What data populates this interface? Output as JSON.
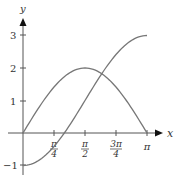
{
  "chart_data": {
    "type": "line",
    "title": "",
    "xlabel": "x",
    "ylabel": "y",
    "x_ticks": [
      {
        "value": 0.7854,
        "label_num": "π",
        "label_den": "4"
      },
      {
        "value": 1.5708,
        "label_num": "π",
        "label_den": "2"
      },
      {
        "value": 2.3562,
        "label_num": "3π",
        "label_den": "4"
      },
      {
        "value": 3.1416,
        "label": "π"
      }
    ],
    "y_ticks": [
      {
        "value": 3,
        "label": "3"
      },
      {
        "value": 2,
        "label": "2"
      },
      {
        "value": 1,
        "label": "1"
      },
      {
        "value": -1,
        "label": "−1"
      }
    ],
    "xlim": [
      0,
      3.1416
    ],
    "ylim": [
      -1,
      3
    ],
    "grid": false,
    "series": [
      {
        "name": "y = 2 sin x",
        "x": [
          0,
          0.3927,
          0.7854,
          1.1781,
          1.5708,
          1.9635,
          2.3562,
          2.7489,
          3.1416
        ],
        "values": [
          0,
          0.765,
          1.414,
          1.848,
          2.0,
          1.848,
          1.414,
          0.765,
          0
        ]
      },
      {
        "name": "y = 1 − 2 cos x",
        "x": [
          0,
          0.3927,
          0.7854,
          1.1781,
          1.5708,
          1.9635,
          2.3562,
          2.7489,
          3.1416
        ],
        "values": [
          -1,
          -0.848,
          -0.414,
          0.235,
          1.0,
          1.765,
          2.414,
          2.848,
          3.0
        ]
      }
    ]
  },
  "axes": {
    "x_label": "x",
    "y_label": "y"
  },
  "ticks": {
    "y3": "3",
    "y2": "2",
    "y1": "1",
    "ym1": "−1",
    "x1_num": "π",
    "x1_den": "4",
    "x2_num": "π",
    "x2_den": "2",
    "x3_num": "3π",
    "x3_den": "4",
    "x4": "π"
  }
}
